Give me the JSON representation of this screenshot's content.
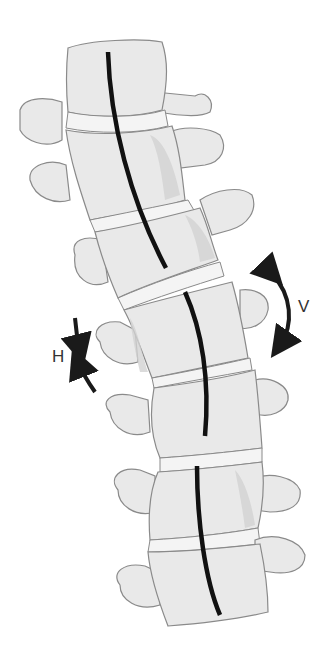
{
  "figure": {
    "labels": {
      "vertical_rotation": "V",
      "horizontal_rotation": "H"
    },
    "vertebra_count": 6,
    "colors": {
      "bone": "#e9e9e9",
      "bone_outline": "#8a8a8a",
      "axis_line": "#111111",
      "arrow": "#1a1a1a",
      "label": "#333333"
    }
  }
}
